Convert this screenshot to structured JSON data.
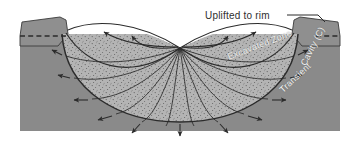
{
  "figure": {
    "width": 360,
    "height": 145
  },
  "labels": {
    "uplifted_to_rim": "Uplifted to rim",
    "excavated_zone": "Excavated Zone",
    "cavity": "Cavity (C)",
    "transient": "Transient"
  },
  "colors": {
    "background": "#ffffff",
    "bedrock_gray": "#8a8a8a",
    "rim_block_gray": "#8f8f8f",
    "excavated_fill": "#b2b2b2",
    "cavity_white": "#ffffff",
    "line_dark": "#2b2b2b",
    "label_light": "#f2f2f2",
    "label_dark": "#2e2e2e"
  },
  "geometry": {
    "ground_surface_y": 36,
    "ground_left_x": 20,
    "ground_right_x": 340,
    "bedrock_bottom_y": 131,
    "impact_point": {
      "x": 180,
      "y": 48
    },
    "transient_cavity_depth_y": 118,
    "transient_cavity_half_width": 118
  },
  "elements": {
    "original_surface_line": "dashed",
    "flow_lines_count": 12,
    "ejecta_arrows_count": 4,
    "displacement_arrows_count": 9
  }
}
